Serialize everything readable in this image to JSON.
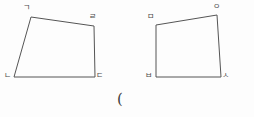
{
  "canvas": {
    "width": 254,
    "height": 117,
    "background_color": "#fdfdfd",
    "stroke_color": "#555555",
    "stroke_width": 1,
    "label_color": "#4a4a4a"
  },
  "figures": [
    {
      "name": "quadrilateral-left",
      "label_text": "ㄱㄴㄷㄹ",
      "vertices": [
        {
          "id": "giyeok",
          "label": "ㄱ",
          "x": 31,
          "y": 17,
          "label_x": 23,
          "label_y": 4
        },
        {
          "id": "rieul",
          "label": "ㄹ",
          "x": 94,
          "y": 26,
          "label_x": 89,
          "label_y": 13
        },
        {
          "id": "digeut",
          "label": "ㄷ",
          "x": 95,
          "y": 77,
          "label_x": 96,
          "label_y": 72
        },
        {
          "id": "nieun",
          "label": "ㄴ",
          "x": 14,
          "y": 77,
          "label_x": 4,
          "label_y": 72
        }
      ]
    },
    {
      "name": "quadrilateral-right",
      "label_text": "ㅁㅂㅅㅇ",
      "vertices": [
        {
          "id": "mieum",
          "label": "ㅁ",
          "x": 156,
          "y": 25,
          "label_x": 147,
          "label_y": 13
        },
        {
          "id": "ieung",
          "label": "ㅇ",
          "x": 217,
          "y": 15,
          "label_x": 213,
          "label_y": 3
        },
        {
          "id": "siot",
          "label": "ㅅ",
          "x": 221,
          "y": 77,
          "label_x": 222,
          "label_y": 72
        },
        {
          "id": "bieup",
          "label": "ㅂ",
          "x": 156,
          "y": 77,
          "label_x": 145,
          "label_y": 72
        }
      ]
    }
  ],
  "caption": {
    "text": "(",
    "x": 117,
    "y": 92
  }
}
